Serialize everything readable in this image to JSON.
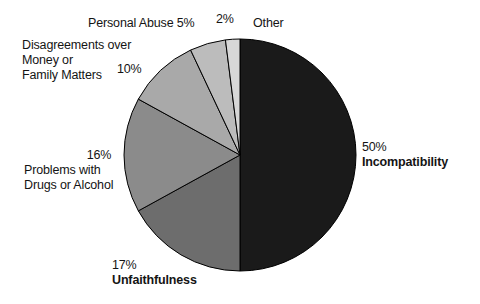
{
  "chart_data": {
    "type": "pie",
    "title": "",
    "subtitle": "",
    "xlabel": "",
    "ylabel": "",
    "legend_position": "none",
    "grid": false,
    "categories": [
      "Incompatibility",
      "Unfaithfulness",
      "Problems with Drugs or Alcohol",
      "Disagreements over Money or Family Matters",
      "Personal Abuse",
      "Other"
    ],
    "values": [
      50,
      17,
      16,
      10,
      5,
      2
    ],
    "units": "percent",
    "slices": [
      {
        "id": "incompatibility",
        "name": "Incompatibility",
        "value": 50,
        "pct_label": "50%",
        "color": "#1a1a1a",
        "start_deg": 0,
        "end_deg": 180,
        "bold_name": true
      },
      {
        "id": "unfaithfulness",
        "name": "Unfaithfulness",
        "value": 17,
        "pct_label": "17%",
        "color": "#6d6d6d",
        "start_deg": 180,
        "end_deg": 241.2,
        "bold_name": true
      },
      {
        "id": "drugs-or-alcohol",
        "name": "Problems with Drugs or Alcohol",
        "name_line1": "Problems with",
        "name_line2": "Drugs or Alcohol",
        "value": 16,
        "pct_label": "16%",
        "color": "#8b8b8b",
        "start_deg": 241.2,
        "end_deg": 298.8,
        "bold_name": false
      },
      {
        "id": "money-or-family",
        "name": "Disagreements over Money or Family Matters",
        "name_line1": "Disagreements over",
        "name_line2": "Money or",
        "name_line3": "Family Matters",
        "value": 10,
        "pct_label": "10%",
        "color": "#a9a9a9",
        "start_deg": 298.8,
        "end_deg": 334.8,
        "bold_name": false
      },
      {
        "id": "personal-abuse",
        "name": "Personal Abuse",
        "value": 5,
        "pct_label": "5%",
        "inline_label": "Personal Abuse 5%",
        "color": "#bcbcbc",
        "start_deg": 334.8,
        "end_deg": 352.8,
        "bold_name": false
      },
      {
        "id": "other",
        "name": "Other",
        "value": 2,
        "pct_label": "2%",
        "color": "#d7d7d7",
        "start_deg": 352.8,
        "end_deg": 360,
        "bold_name": false
      }
    ],
    "geometry": {
      "center_x": 240,
      "center_y": 155,
      "radius": 116,
      "stroke_color": "#000000",
      "stroke_width": 1
    },
    "background_color": "#ffffff",
    "text_color": "#141414"
  }
}
